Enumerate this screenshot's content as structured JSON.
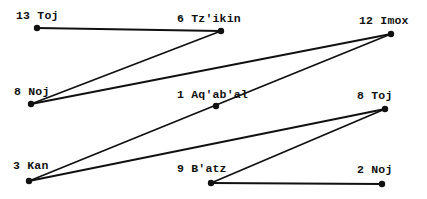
{
  "diagram": {
    "title": "",
    "line_color": "#111111",
    "dot_color": "#111111",
    "background": "#ffffff",
    "nodes": [
      {
        "id": "n1",
        "label": "13 Toj",
        "x": 37,
        "y": 28,
        "label_x": 16,
        "label_y": 10
      },
      {
        "id": "n2",
        "label": "6 Tz'ikin",
        "x": 221,
        "y": 31,
        "label_x": 177,
        "label_y": 13
      },
      {
        "id": "n3",
        "label": "12 Imox",
        "x": 391,
        "y": 34,
        "label_x": 359,
        "label_y": 15
      },
      {
        "id": "n4",
        "label": "8 Noj",
        "x": 31,
        "y": 104,
        "label_x": 14,
        "label_y": 86
      },
      {
        "id": "n5",
        "label": "1 Aq'ab'al",
        "x": 216,
        "y": 106,
        "label_x": 177,
        "label_y": 89
      },
      {
        "id": "n6",
        "label": "8 Toj",
        "x": 385,
        "y": 109,
        "label_x": 357,
        "label_y": 90
      },
      {
        "id": "n7",
        "label": "3 Kan",
        "x": 29,
        "y": 181,
        "label_x": 13,
        "label_y": 160
      },
      {
        "id": "n8",
        "label": "9 B'atz",
        "x": 211,
        "y": 183,
        "label_x": 177,
        "label_y": 163
      },
      {
        "id": "n9",
        "label": "2 Noj",
        "x": 382,
        "y": 184,
        "label_x": 357,
        "label_y": 164
      }
    ],
    "edges": [
      {
        "from": "n1",
        "to": "n2"
      },
      {
        "from": "n2",
        "to": "n4"
      },
      {
        "from": "n4",
        "to": "n3"
      },
      {
        "from": "n3",
        "to": "n7"
      },
      {
        "from": "n7",
        "to": "n6"
      },
      {
        "from": "n6",
        "to": "n8"
      },
      {
        "from": "n8",
        "to": "n9"
      }
    ]
  }
}
